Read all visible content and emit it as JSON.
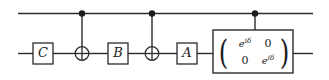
{
  "diagram": {
    "type": "quantum-circuit",
    "wires": [
      {
        "name": "control-wire",
        "label": ""
      },
      {
        "name": "target-wire",
        "label": ""
      }
    ],
    "gates": [
      {
        "id": "gate-c",
        "label": "C",
        "kind": "box",
        "wire": "target"
      },
      {
        "id": "cnot-1",
        "label": "⊕",
        "kind": "cnot-target",
        "wire": "target"
      },
      {
        "id": "gate-b",
        "label": "B",
        "kind": "box",
        "wire": "target"
      },
      {
        "id": "cnot-2",
        "label": "⊕",
        "kind": "cnot-target",
        "wire": "target"
      },
      {
        "id": "gate-a",
        "label": "A",
        "kind": "box",
        "wire": "target"
      },
      {
        "id": "phase-gate",
        "label": "",
        "kind": "matrix",
        "wire": "target"
      }
    ],
    "controls": [
      {
        "id": "control-dot-1",
        "label": "•"
      },
      {
        "id": "control-dot-2",
        "label": "•"
      },
      {
        "id": "control-dot-3",
        "label": "•"
      }
    ],
    "matrix": {
      "rows": [
        [
          {
            "base": "e",
            "exp": "iδ"
          },
          {
            "base": "0",
            "exp": ""
          }
        ],
        [
          {
            "base": "0",
            "exp": ""
          },
          {
            "base": "e",
            "exp": "iδ"
          }
        ]
      ],
      "left_paren": "(",
      "right_paren": ")"
    },
    "colors": {
      "ink": "#1c1c1c",
      "line": "#2b2b2b",
      "background": "#ffffff"
    }
  }
}
